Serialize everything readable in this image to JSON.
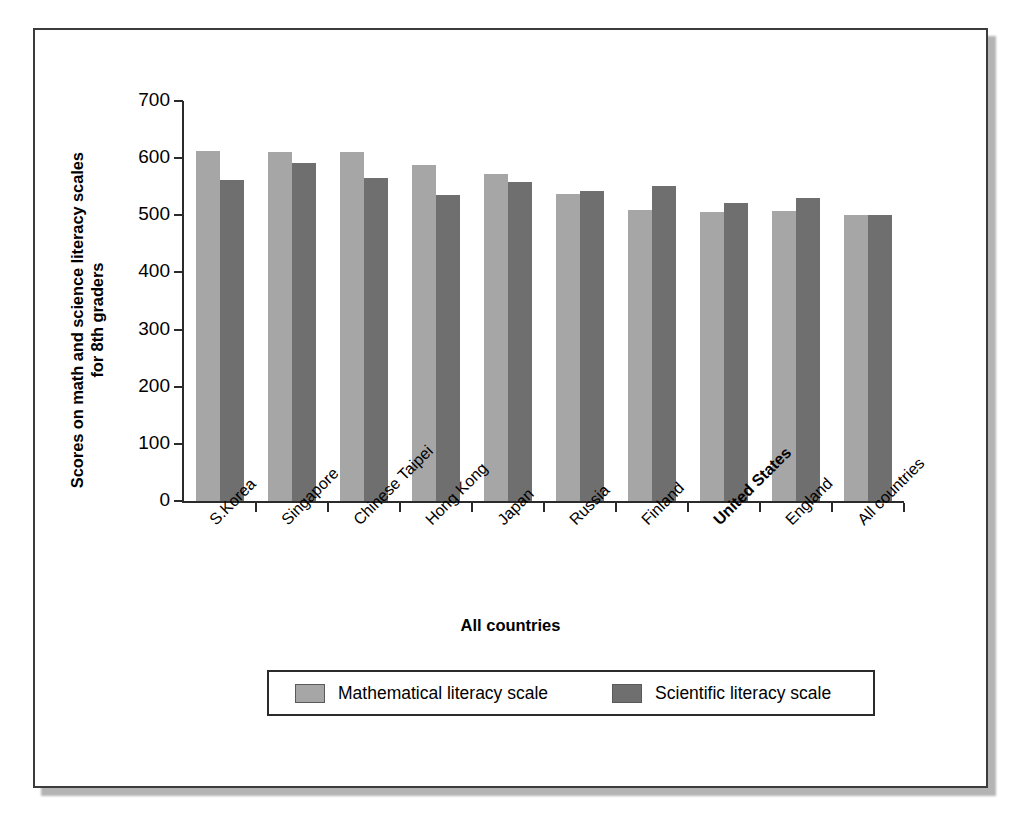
{
  "chart_data": {
    "type": "bar",
    "title": "",
    "xlabel": "All countries",
    "ylabel": "Scores on math and science literacy scales for 8th graders",
    "ylim": [
      0,
      700
    ],
    "ytick_labels": [
      "700",
      "600",
      "500",
      "400",
      "300",
      "200",
      "100",
      "0"
    ],
    "ytick_values": [
      700,
      600,
      500,
      400,
      300,
      200,
      100,
      0
    ],
    "grid": false,
    "legend_position": "bottom-center",
    "categories": [
      "S.Korea",
      "Singapore",
      "Chinese Taipei",
      "Hong Kong",
      "Japan",
      "Russia",
      "Finland",
      "United States",
      "England",
      "All countries"
    ],
    "highlighted_category": "United States",
    "series": [
      {
        "name": "Mathematical literacy scale",
        "color": "#a6a6a6",
        "values": [
          613,
          611,
          611,
          588,
          572,
          538,
          510,
          506,
          507,
          500
        ]
      },
      {
        "name": "Scientific literacy scale",
        "color": "#6f6f6f",
        "values": [
          561,
          592,
          565,
          535,
          559,
          542,
          551,
          521,
          531,
          500
        ]
      }
    ]
  },
  "legend": {
    "entries": [
      {
        "label": "Mathematical literacy scale",
        "swatch": "math-swatch"
      },
      {
        "label": "Scientific literacy scale",
        "swatch": "science-swatch"
      }
    ]
  },
  "axes": {
    "y_title": "Scores on math and science literacy scales for 8th graders",
    "x_title": "All countries"
  }
}
